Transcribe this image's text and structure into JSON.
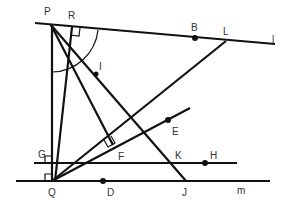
{
  "diagram": {
    "type": "geometry",
    "colors": {
      "stroke": "#111111",
      "label": "#333333",
      "background": "#ffffff"
    },
    "points": {
      "P": {
        "label": "P",
        "x": 51,
        "y": 25,
        "lx": 44,
        "ly": 15
      },
      "R": {
        "label": "R",
        "x": 72,
        "y": 27,
        "lx": 69,
        "ly": 18
      },
      "B": {
        "label": "B",
        "x": 195,
        "y": 38,
        "lx": 191,
        "ly": 30
      },
      "L": {
        "label": "L",
        "x": 226,
        "y": 41,
        "lx": 223,
        "ly": 34
      },
      "l": {
        "label": "l",
        "lx": 272,
        "ly": 41
      },
      "I": {
        "label": "I",
        "x": 96,
        "y": 74,
        "lx": 99,
        "ly": 69
      },
      "E": {
        "label": "E",
        "x": 168,
        "y": 120,
        "lx": 172,
        "ly": 133
      },
      "F": {
        "label": "F",
        "x": 113,
        "y": 145,
        "lx": 118,
        "ly": 159
      },
      "G": {
        "label": "G",
        "lx": 39,
        "ly": 156
      },
      "K": {
        "label": "K",
        "x": 173,
        "y": 163,
        "lx": 175,
        "ly": 157
      },
      "H": {
        "label": "H",
        "x": 205,
        "y": 163,
        "lx": 211,
        "ly": 157
      },
      "Q": {
        "label": "Q",
        "x": 52,
        "y": 181,
        "lx": 49,
        "ly": 195
      },
      "D": {
        "label": "D",
        "x": 103,
        "y": 181,
        "lx": 107,
        "ly": 194
      },
      "J": {
        "label": "J",
        "x": 186,
        "y": 181,
        "lx": 182,
        "ly": 194
      },
      "m": {
        "label": "m",
        "lx": 237,
        "ly": 192
      }
    },
    "lines": [
      {
        "name": "line-l",
        "from": [
          35,
          23
        ],
        "to": [
          275,
          44
        ]
      },
      {
        "name": "line-m",
        "from": [
          16,
          181
        ],
        "to": [
          270,
          181
        ]
      },
      {
        "name": "line-gh",
        "from": [
          34,
          163
        ],
        "to": [
          237,
          163
        ]
      },
      {
        "name": "segment-pq",
        "from": [
          52,
          25
        ],
        "to": [
          52,
          181
        ]
      },
      {
        "name": "segment-rq",
        "from": [
          72,
          27
        ],
        "to": [
          55,
          181
        ]
      },
      {
        "name": "segment-pj",
        "from": [
          51,
          25
        ],
        "to": [
          186,
          181
        ]
      },
      {
        "name": "segment-pf",
        "from": [
          51,
          25
        ],
        "to": [
          113,
          145
        ]
      },
      {
        "name": "segment-ql",
        "from": [
          52,
          181
        ],
        "to": [
          226,
          41
        ]
      },
      {
        "name": "ray-qe",
        "from": [
          52,
          181
        ],
        "to": [
          190,
          108
        ]
      }
    ],
    "right_angles": [
      "R",
      "F",
      "G",
      "Q"
    ],
    "arc": {
      "center": "P",
      "radius": 47
    }
  }
}
